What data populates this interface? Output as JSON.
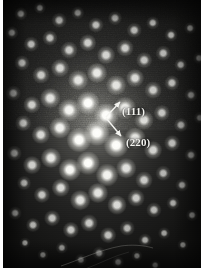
{
  "figure": {
    "kind": "electron-diffraction-pattern",
    "technique": "Selected Area Electron Diffraction (SAED)",
    "plate": {
      "x": 3,
      "y": 0,
      "width": 198,
      "height": 268
    },
    "background_color": "#1c1c1b",
    "spot_color": "#ffffff",
    "annotation_color": "#f2f2ee"
  },
  "annotations": {
    "items": [
      {
        "id": "reflection-111",
        "label": "(111)",
        "label_x": 119,
        "label_y": 105,
        "arrow": {
          "x1": 103,
          "y1": 117,
          "x2": 117,
          "y2": 102
        }
      },
      {
        "id": "reflection-220",
        "label": "(220)",
        "label_x": 123,
        "label_y": 136,
        "arrow": {
          "x1": 103,
          "y1": 118,
          "x2": 118,
          "y2": 136
        }
      }
    ]
  },
  "chart_data": {
    "type": "scatter",
    "title": "",
    "xlabel": "",
    "ylabel": "",
    "xlim": [
      0,
      198
    ],
    "ylim": [
      0,
      268
    ],
    "grid": false,
    "legend": "none",
    "series": [
      {
        "name": "diffraction spots",
        "units": "pixels on plate",
        "note": "oblique/hexagonal reciprocal lattice; x, y, relative intensity 0-1, radius px",
        "points": [
          [
            18,
            14,
            0.3,
            2.4
          ],
          [
            37,
            8,
            0.26,
            2.2
          ],
          [
            56,
            20,
            0.34,
            2.6
          ],
          [
            75,
            13,
            0.3,
            2.4
          ],
          [
            93,
            25,
            0.4,
            2.7
          ],
          [
            112,
            18,
            0.34,
            2.5
          ],
          [
            131,
            30,
            0.36,
            2.6
          ],
          [
            150,
            23,
            0.3,
            2.4
          ],
          [
            168,
            35,
            0.28,
            2.3
          ],
          [
            187,
            28,
            0.22,
            2.1
          ],
          [
            9,
            33,
            0.3,
            2.4
          ],
          [
            28,
            44,
            0.36,
            2.6
          ],
          [
            47,
            38,
            0.4,
            2.7
          ],
          [
            66,
            50,
            0.48,
            3.0
          ],
          [
            85,
            43,
            0.52,
            3.1
          ],
          [
            103,
            55,
            0.56,
            3.2
          ],
          [
            122,
            48,
            0.5,
            3.0
          ],
          [
            141,
            60,
            0.44,
            2.8
          ],
          [
            160,
            53,
            0.36,
            2.6
          ],
          [
            178,
            65,
            0.3,
            2.4
          ],
          [
            196,
            58,
            0.22,
            2.1
          ],
          [
            19,
            63,
            0.38,
            2.7
          ],
          [
            38,
            75,
            0.48,
            3.0
          ],
          [
            57,
            68,
            0.56,
            3.2
          ],
          [
            75,
            80,
            0.66,
            3.5
          ],
          [
            94,
            73,
            0.72,
            3.6
          ],
          [
            113,
            85,
            0.66,
            3.5
          ],
          [
            132,
            78,
            0.58,
            3.2
          ],
          [
            150,
            90,
            0.48,
            3.0
          ],
          [
            169,
            83,
            0.38,
            2.7
          ],
          [
            188,
            95,
            0.28,
            2.3
          ],
          [
            10,
            93,
            0.36,
            2.6
          ],
          [
            29,
            105,
            0.52,
            3.1
          ],
          [
            47,
            98,
            0.66,
            3.5
          ],
          [
            66,
            110,
            0.8,
            3.9
          ],
          [
            85,
            103,
            0.88,
            4.1
          ],
          [
            103,
            115,
            0.92,
            4.2
          ],
          [
            122,
            108,
            0.8,
            3.9
          ],
          [
            141,
            120,
            0.62,
            3.4
          ],
          [
            159,
            113,
            0.46,
            2.9
          ],
          [
            178,
            125,
            0.34,
            2.5
          ],
          [
            197,
            118,
            0.24,
            2.2
          ],
          [
            20,
            123,
            0.42,
            2.8
          ],
          [
            38,
            135,
            0.6,
            3.3
          ],
          [
            57,
            128,
            0.78,
            3.8
          ],
          [
            76,
            140,
            0.92,
            4.3
          ],
          [
            94,
            133,
            1.0,
            4.5
          ],
          [
            113,
            145,
            0.9,
            4.2
          ],
          [
            132,
            138,
            0.74,
            3.7
          ],
          [
            150,
            150,
            0.56,
            3.2
          ],
          [
            169,
            143,
            0.4,
            2.8
          ],
          [
            188,
            155,
            0.28,
            2.3
          ],
          [
            11,
            153,
            0.36,
            2.6
          ],
          [
            29,
            165,
            0.54,
            3.2
          ],
          [
            48,
            158,
            0.72,
            3.6
          ],
          [
            67,
            170,
            0.84,
            4.0
          ],
          [
            85,
            163,
            0.88,
            4.1
          ],
          [
            104,
            175,
            0.8,
            3.9
          ],
          [
            123,
            168,
            0.66,
            3.5
          ],
          [
            141,
            180,
            0.5,
            3.0
          ],
          [
            160,
            173,
            0.36,
            2.6
          ],
          [
            179,
            185,
            0.26,
            2.3
          ],
          [
            21,
            183,
            0.32,
            2.5
          ],
          [
            39,
            195,
            0.46,
            2.9
          ],
          [
            58,
            188,
            0.6,
            3.3
          ],
          [
            77,
            200,
            0.68,
            3.5
          ],
          [
            95,
            193,
            0.7,
            3.6
          ],
          [
            114,
            205,
            0.62,
            3.4
          ],
          [
            133,
            198,
            0.5,
            3.0
          ],
          [
            151,
            210,
            0.38,
            2.7
          ],
          [
            170,
            203,
            0.28,
            2.3
          ],
          [
            189,
            215,
            0.2,
            2.1
          ],
          [
            12,
            213,
            0.26,
            2.3
          ],
          [
            30,
            225,
            0.34,
            2.5
          ],
          [
            49,
            218,
            0.44,
            2.8
          ],
          [
            68,
            230,
            0.48,
            2.9
          ],
          [
            86,
            223,
            0.5,
            3.0
          ],
          [
            105,
            235,
            0.44,
            2.8
          ],
          [
            124,
            228,
            0.36,
            2.6
          ],
          [
            142,
            240,
            0.28,
            2.3
          ],
          [
            161,
            233,
            0.22,
            2.1
          ],
          [
            180,
            245,
            0.18,
            2.0
          ],
          [
            22,
            243,
            0.18,
            2.0
          ],
          [
            40,
            255,
            0.2,
            2.0
          ],
          [
            59,
            248,
            0.24,
            2.2
          ],
          [
            78,
            260,
            0.24,
            2.2
          ],
          [
            96,
            253,
            0.26,
            2.3
          ],
          [
            115,
            262,
            0.22,
            2.1
          ],
          [
            134,
            256,
            0.2,
            2.0
          ],
          [
            152,
            265,
            0.16,
            1.9
          ]
        ]
      }
    ]
  }
}
